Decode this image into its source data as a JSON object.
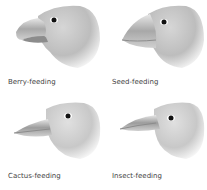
{
  "figure": {
    "panels": [
      {
        "id": "berry",
        "label": "Berry-feeding",
        "beak": "short-thick-curved"
      },
      {
        "id": "seed",
        "label": "Seed-feeding",
        "beak": "large-conical"
      },
      {
        "id": "cactus",
        "label": "Cactus-feeding",
        "beak": "long-pointed"
      },
      {
        "id": "insect",
        "label": "Insect-feeding",
        "beak": "thin-pointed"
      }
    ],
    "colors": {
      "head": "#c8c8c8",
      "beak": "#b0b0b0",
      "eye": "#111111",
      "text": "#444444"
    }
  }
}
